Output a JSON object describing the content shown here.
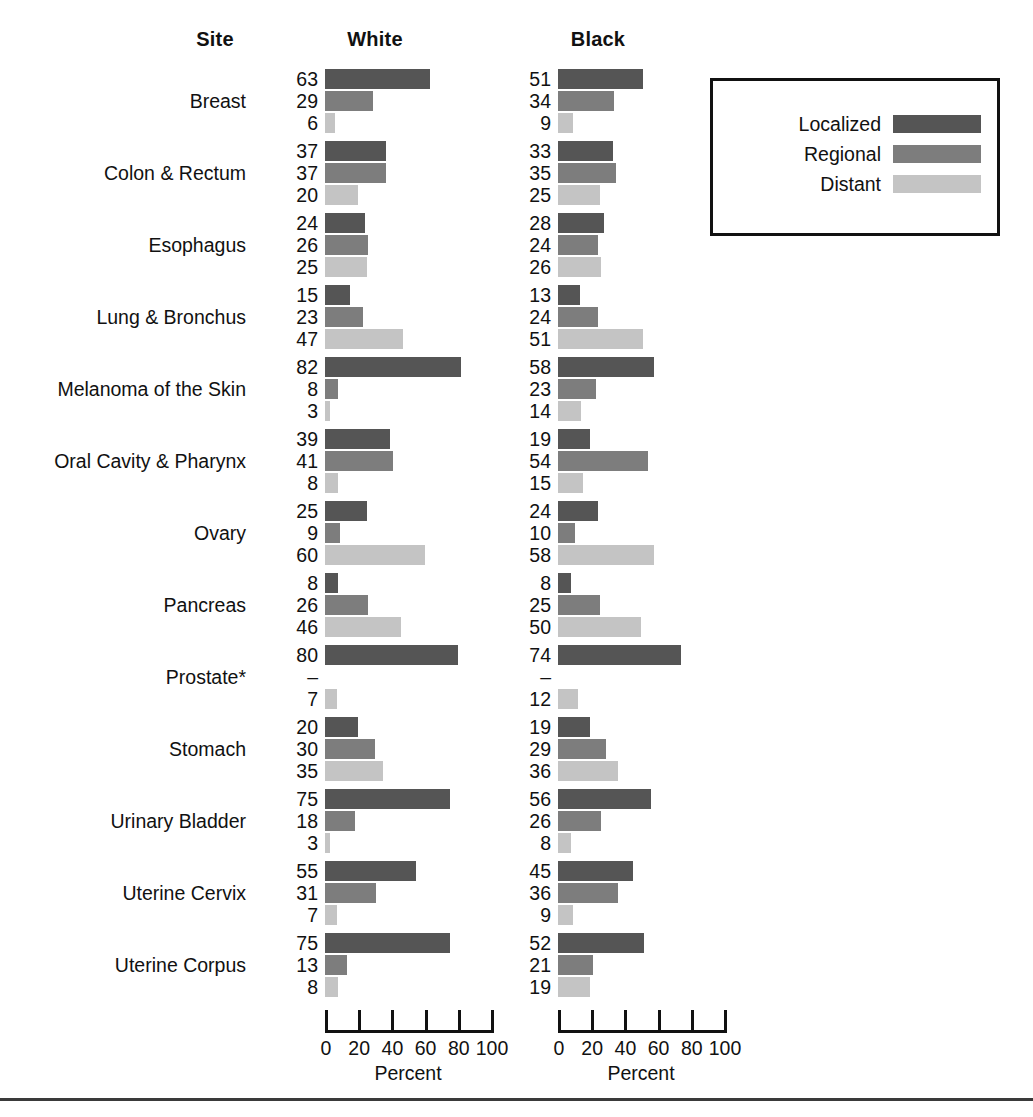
{
  "header": {
    "site_label": "Site",
    "white_label": "White",
    "black_label": "Black"
  },
  "legend": {
    "items": [
      {
        "label": "Localized",
        "color": "#555555",
        "key": "localized"
      },
      {
        "label": "Regional",
        "color": "#7d7d7d",
        "key": "regional"
      },
      {
        "label": "Distant",
        "color": "#c4c4c4",
        "key": "distant"
      }
    ]
  },
  "axis": {
    "title": "Percent",
    "ticks": [
      0,
      20,
      40,
      60,
      80,
      100
    ],
    "tick_labels": [
      "0",
      "20",
      "40",
      "60",
      "80",
      "100"
    ],
    "min": 0,
    "max": 100,
    "pixels_per_unit": 1.66
  },
  "chart_data": {
    "type": "bar",
    "title": "",
    "subtitle": "",
    "xlabel": "Percent",
    "ylabel": "Site",
    "xlim": [
      0,
      100
    ],
    "grid": false,
    "legend_position": "top-right",
    "orientation": "horizontal",
    "group_headers": [
      "Site",
      "White",
      "Black"
    ],
    "stage_categories": [
      "Localized",
      "Regional",
      "Distant"
    ],
    "categories": [
      "Breast",
      "Colon & Rectum",
      "Esophagus",
      "Lung & Bronchus",
      "Melanoma of the Skin",
      "Oral Cavity & Pharynx",
      "Ovary",
      "Pancreas",
      "Prostate*",
      "Stomach",
      "Urinary Bladder",
      "Uterine Cervix",
      "Uterine Corpus"
    ],
    "series": [
      {
        "name": "White",
        "values": [
          [
            63,
            29,
            6
          ],
          [
            37,
            37,
            20
          ],
          [
            24,
            26,
            25
          ],
          [
            15,
            23,
            47
          ],
          [
            82,
            8,
            3
          ],
          [
            39,
            41,
            8
          ],
          [
            25,
            9,
            60
          ],
          [
            8,
            26,
            46
          ],
          [
            80,
            null,
            7
          ],
          [
            20,
            30,
            35
          ],
          [
            75,
            18,
            3
          ],
          [
            55,
            31,
            7
          ],
          [
            75,
            13,
            8
          ]
        ],
        "display": [
          [
            "63",
            "29",
            "6"
          ],
          [
            "37",
            "37",
            "20"
          ],
          [
            "24",
            "26",
            "25"
          ],
          [
            "15",
            "23",
            "47"
          ],
          [
            "82",
            "8",
            "3"
          ],
          [
            "39",
            "41",
            "8"
          ],
          [
            "25",
            "9",
            "60"
          ],
          [
            "8",
            "26",
            "46"
          ],
          [
            "80",
            "–",
            "7"
          ],
          [
            "20",
            "30",
            "35"
          ],
          [
            "75",
            "18",
            "3"
          ],
          [
            "55",
            "31",
            "7"
          ],
          [
            "75",
            "13",
            "8"
          ]
        ]
      },
      {
        "name": "Black",
        "values": [
          [
            51,
            34,
            9
          ],
          [
            33,
            35,
            25
          ],
          [
            28,
            24,
            26
          ],
          [
            13,
            24,
            51
          ],
          [
            58,
            23,
            14
          ],
          [
            19,
            54,
            15
          ],
          [
            24,
            10,
            58
          ],
          [
            8,
            25,
            50
          ],
          [
            74,
            null,
            12
          ],
          [
            19,
            29,
            36
          ],
          [
            56,
            26,
            8
          ],
          [
            45,
            36,
            9
          ],
          [
            52,
            21,
            19
          ]
        ],
        "display": [
          [
            "51",
            "34",
            "9"
          ],
          [
            "33",
            "35",
            "25"
          ],
          [
            "28",
            "24",
            "26"
          ],
          [
            "13",
            "24",
            "51"
          ],
          [
            "58",
            "23",
            "14"
          ],
          [
            "19",
            "54",
            "15"
          ],
          [
            "24",
            "10",
            "58"
          ],
          [
            "8",
            "25",
            "50"
          ],
          [
            "74",
            "–",
            "12"
          ],
          [
            "19",
            "29",
            "36"
          ],
          [
            "56",
            "26",
            "8"
          ],
          [
            "45",
            "36",
            "9"
          ],
          [
            "52",
            "21",
            "19"
          ]
        ]
      }
    ]
  }
}
